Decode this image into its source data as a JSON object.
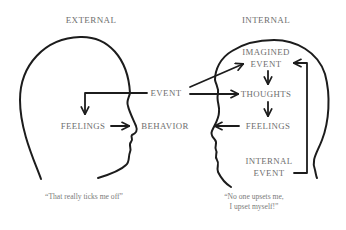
{
  "diagram": {
    "type": "concept-diagram",
    "panels": [
      {
        "id": "external",
        "title": "EXTERNAL",
        "nodes": [
          "EVENT",
          "FEELINGS",
          "BEHAVIOR"
        ],
        "flow": [
          "EVENT → FEELINGS",
          "FEELINGS → BEHAVIOR"
        ],
        "quote": "“That really ticks me off”"
      },
      {
        "id": "internal",
        "title": "INTERNAL",
        "nodes": [
          "IMAGINED EVENT",
          "THOUGHTS",
          "FEELINGS",
          "INTERNAL EVENT"
        ],
        "flow": [
          "EVENT → IMAGINED EVENT",
          "EVENT → THOUGHTS",
          "IMAGINED EVENT → THOUGHTS",
          "THOUGHTS → FEELINGS",
          "FEELINGS → BEHAVIOR",
          "INTERNAL EVENT → IMAGINED EVENT"
        ],
        "quote_line1": "“No one upsets me,",
        "quote_line2": "I upset myself!”"
      }
    ],
    "labels": {
      "external_title": "EXTERNAL",
      "internal_title": "INTERNAL",
      "event": "EVENT",
      "behavior": "BEHAVIOR",
      "left_feelings": "FEELINGS",
      "imagined": "IMAGINED",
      "imagined_event": "EVENT",
      "thoughts": "THOUGHTS",
      "right_feelings": "FEELINGS",
      "internal": "INTERNAL",
      "internal_event": "EVENT",
      "left_quote": "“That really ticks me off”",
      "right_quote_line1": "“No one upsets me,",
      "right_quote_line2": "I upset myself!”"
    },
    "colors": {
      "line": "#1c1c1c",
      "text": "#6e6e6e",
      "background": "#ffffff"
    }
  }
}
